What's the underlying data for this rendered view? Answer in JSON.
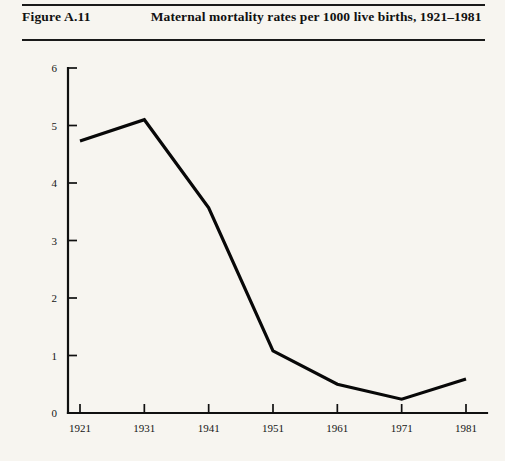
{
  "header": {
    "figure_number": "Figure A.11",
    "title": "Maternal mortality rates per 1000 live births, 1921–1981"
  },
  "chart_data": {
    "type": "line",
    "title": "Maternal mortality rates per 1000 live births, 1921–1981",
    "xlabel": "",
    "ylabel": "",
    "x": [
      1921,
      1931,
      1941,
      1951,
      1961,
      1971,
      1981
    ],
    "categories": [
      "1921",
      "1931",
      "1941",
      "1951",
      "1961",
      "1971",
      "1981"
    ],
    "values": [
      4.73,
      5.1,
      3.57,
      1.08,
      0.5,
      0.24,
      0.59
    ],
    "series": [
      {
        "name": "Maternal mortality rate per 1000 live births",
        "values": [
          4.73,
          5.1,
          3.57,
          1.08,
          0.5,
          0.24,
          0.59
        ]
      }
    ],
    "xlim": [
      1921,
      1981
    ],
    "ylim": [
      0,
      6
    ],
    "y_ticks": [
      0,
      1,
      2,
      3,
      4,
      5,
      6
    ],
    "y_tick_labels": [
      "0",
      "1",
      "2",
      "3",
      "4",
      "5",
      "6"
    ],
    "x_ticks": [
      1921,
      1931,
      1941,
      1951,
      1961,
      1971,
      1981
    ],
    "x_tick_labels": [
      "1921",
      "1931",
      "1941",
      "1951",
      "1961",
      "1971",
      "1981"
    ],
    "grid": false,
    "legend": false,
    "line_color": "#080808"
  }
}
